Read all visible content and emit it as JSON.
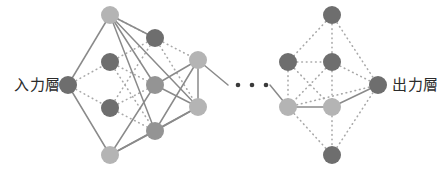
{
  "diagram": {
    "labels": {
      "input_layer": "入力層",
      "output_layer": "出力層"
    },
    "ellipsis": "• • •",
    "colors": {
      "node_dark": "#6e6e6e",
      "node_mid": "#949494",
      "node_light": "#b4b4b4",
      "edge_solid": "#8a8a8a",
      "edge_dotted": "#a8a8a8",
      "label_text": "#2b2b2b",
      "background": "#ffffff"
    },
    "node_radius": 9,
    "ellipsis_dots": 3,
    "nodes": {
      "left": [
        {
          "id": "in",
          "name": "input-node",
          "x": 68,
          "y": 85,
          "tone": "dark"
        },
        {
          "id": "a1",
          "name": "left-layer1-node-1",
          "x": 110,
          "y": 15,
          "tone": "light"
        },
        {
          "id": "a2",
          "name": "left-layer1-node-2",
          "x": 110,
          "y": 62,
          "tone": "dark"
        },
        {
          "id": "a3",
          "name": "left-layer1-node-3",
          "x": 110,
          "y": 108,
          "tone": "dark"
        },
        {
          "id": "a4",
          "name": "left-layer1-node-4",
          "x": 110,
          "y": 155,
          "tone": "light"
        },
        {
          "id": "b1",
          "name": "left-layer2-node-1",
          "x": 155,
          "y": 38,
          "tone": "dark"
        },
        {
          "id": "b2",
          "name": "left-layer2-node-2",
          "x": 155,
          "y": 85,
          "tone": "mid"
        },
        {
          "id": "b3",
          "name": "left-layer2-node-3",
          "x": 155,
          "y": 131,
          "tone": "mid"
        },
        {
          "id": "c1",
          "name": "left-layer3-node-1",
          "x": 198,
          "y": 60,
          "tone": "light"
        },
        {
          "id": "c2",
          "name": "left-layer3-node-2",
          "x": 198,
          "y": 107,
          "tone": "light"
        }
      ],
      "right": [
        {
          "id": "r0",
          "name": "right-layer1-node-top",
          "x": 332,
          "y": 15,
          "tone": "dark"
        },
        {
          "id": "r1",
          "name": "right-layer1-node-1",
          "x": 288,
          "y": 62,
          "tone": "dark"
        },
        {
          "id": "r2",
          "name": "right-layer2-node-1",
          "x": 332,
          "y": 62,
          "tone": "dark"
        },
        {
          "id": "r3",
          "name": "right-layer1-node-2",
          "x": 288,
          "y": 107,
          "tone": "light"
        },
        {
          "id": "r4",
          "name": "right-layer2-node-2",
          "x": 332,
          "y": 107,
          "tone": "light"
        },
        {
          "id": "r5",
          "name": "right-layer2-node-bot",
          "x": 332,
          "y": 155,
          "tone": "dark"
        },
        {
          "id": "out",
          "name": "output-node",
          "x": 378,
          "y": 85,
          "tone": "dark"
        }
      ]
    },
    "edges": {
      "solid": [
        [
          "in",
          "a1"
        ],
        [
          "in",
          "a4"
        ],
        [
          "a1",
          "b1"
        ],
        [
          "a1",
          "b2"
        ],
        [
          "a1",
          "b3"
        ],
        [
          "a1",
          "c2"
        ],
        [
          "a4",
          "b2"
        ],
        [
          "a4",
          "b3"
        ],
        [
          "a4",
          "c2"
        ],
        [
          "b2",
          "c1"
        ],
        [
          "b2",
          "c2"
        ],
        [
          "b3",
          "c1"
        ],
        [
          "b3",
          "c2"
        ],
        [
          "c1",
          "c2"
        ],
        [
          "r3",
          "r4"
        ],
        [
          "r4",
          "out"
        ]
      ],
      "dotted": [
        [
          "in",
          "a2"
        ],
        [
          "in",
          "a3"
        ],
        [
          "a2",
          "b1"
        ],
        [
          "a2",
          "b2"
        ],
        [
          "a2",
          "b3"
        ],
        [
          "a3",
          "b1"
        ],
        [
          "a3",
          "b2"
        ],
        [
          "a3",
          "b3"
        ],
        [
          "b1",
          "c1"
        ],
        [
          "b1",
          "c2"
        ],
        [
          "a1",
          "b1"
        ],
        [
          "r0",
          "r1"
        ],
        [
          "r0",
          "r2"
        ],
        [
          "r0",
          "out"
        ],
        [
          "r1",
          "r2"
        ],
        [
          "r1",
          "r3"
        ],
        [
          "r1",
          "r4"
        ],
        [
          "r2",
          "r3"
        ],
        [
          "r2",
          "r4"
        ],
        [
          "r2",
          "out"
        ],
        [
          "r3",
          "r5"
        ],
        [
          "r4",
          "r5"
        ],
        [
          "r5",
          "out"
        ],
        [
          "r3",
          "out"
        ]
      ]
    },
    "stub_edges": {
      "left_to_gap": {
        "from_node": "c1",
        "to_x": 228,
        "to_y": 85
      },
      "gap_to_right": {
        "from_x": 270,
        "from_y": 85,
        "to_node": "r3"
      }
    },
    "ellipsis_points": [
      {
        "x": 238,
        "y": 85
      },
      {
        "x": 252,
        "y": 85
      },
      {
        "x": 266,
        "y": 85
      }
    ]
  }
}
